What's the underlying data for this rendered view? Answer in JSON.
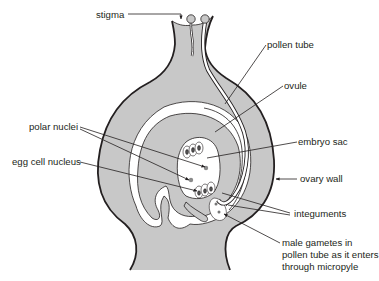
{
  "colors": {
    "tissue": "#c8c8c8",
    "outline": "#231f20",
    "cavity": "#ffffff",
    "nucleus": "#8a8a8a",
    "background": "#ffffff"
  },
  "labels": {
    "stigma": "stigma",
    "pollen_tube": "pollen tube",
    "ovule": "ovule",
    "polar_nuclei": "polar nuclei",
    "embryo_sac": "embryo sac",
    "egg_cell_nucleus": "egg cell nucleus",
    "ovary_wall": "ovary wall",
    "integuments": "integuments",
    "male_gametes_line1": "male gametes in",
    "male_gametes_line2": "pollen tube as it enters",
    "male_gametes_line3": "through micropyle"
  }
}
